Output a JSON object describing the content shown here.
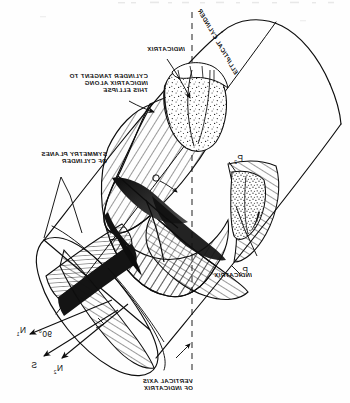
{
  "figure": {
    "title_semantic": "elliptical-cylinder-tangent-to-indicatrix",
    "mirrored": true,
    "background_color": "#fefefe",
    "ink_color": "#0d0d0d"
  },
  "labels": {
    "indicatrix_top": "INDICATRIX",
    "indicatrix_right": "INDICATRIX",
    "cylinder_tangent": "CYLINDER TANGENT TO\nINDICATRIX ALONG\nTHIS ELLIPSE",
    "symmetry_planes": "SYMMETRY PLANES\nOF CYLINDER",
    "elliptical_cylinder": "ELLIPTICAL CYLINDER",
    "vertical_axis": "VERTICAL AXIS\nOF INDICATRIX"
  },
  "annotations": {
    "origin": "O",
    "point_p1": "P",
    "point_p1_sub": "1",
    "point_p2": "P",
    "point_p2_sub": "2",
    "normal_n1": "N",
    "normal_n1_sub": "1",
    "normal_n2": "N",
    "normal_n2_sub": "2",
    "ray_s": "S",
    "angle": "90°"
  },
  "colors": {
    "ink": "#0d0d0d",
    "paper": "#fefefe",
    "hatch": "#101010",
    "stipple": "#1a1a1a",
    "dashed_axis": "#2a2a2a"
  }
}
